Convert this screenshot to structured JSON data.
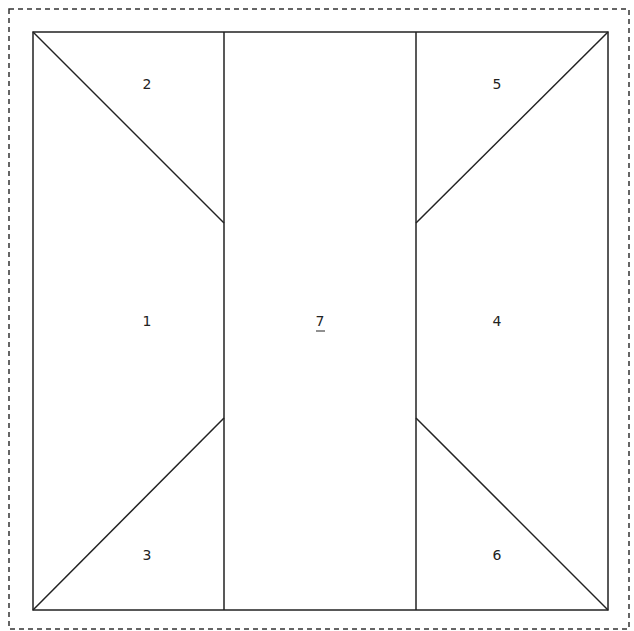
{
  "diagram": {
    "type": "quilt-block-pattern",
    "seam_allowance_border": "dashed",
    "pieces": [
      {
        "id": "1",
        "label": "1",
        "shape": "quadrilateral"
      },
      {
        "id": "2",
        "label": "2",
        "shape": "triangle"
      },
      {
        "id": "3",
        "label": "3",
        "shape": "triangle"
      },
      {
        "id": "4",
        "label": "4",
        "shape": "quadrilateral"
      },
      {
        "id": "5",
        "label": "5",
        "shape": "triangle"
      },
      {
        "id": "6",
        "label": "6",
        "shape": "triangle"
      },
      {
        "id": "7",
        "label": "7",
        "shape": "rectangle",
        "underlined": true
      }
    ],
    "colors": {
      "line": "#222222",
      "background": "#ffffff"
    }
  }
}
